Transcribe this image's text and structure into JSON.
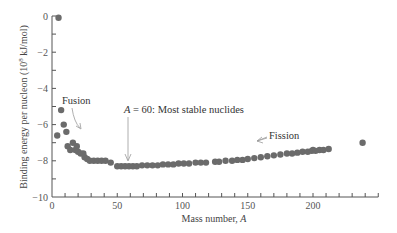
{
  "chart_data": {
    "type": "scatter",
    "title": "",
    "xlabel": "Mass number, A",
    "ylabel": "Binding energy per nucleon (10^8 kJ/mol)",
    "xlim": [
      0,
      250
    ],
    "ylim": [
      -10,
      0
    ],
    "x_ticks": [
      0,
      50,
      100,
      150,
      200
    ],
    "x_minor_step": 10,
    "y_ticks": [
      0,
      -2,
      -4,
      -6,
      -8,
      -10
    ],
    "y_minor_step": 1,
    "grid": false,
    "legend": null,
    "series": [
      {
        "name": "nuclides",
        "points": [
          [
            5,
            -0.1
          ],
          [
            4,
            -6.6
          ],
          [
            7,
            -5.2
          ],
          [
            9,
            -6.0
          ],
          [
            11,
            -6.4
          ],
          [
            12,
            -7.2
          ],
          [
            16,
            -7.0
          ],
          [
            14,
            -7.4
          ],
          [
            18,
            -7.4
          ],
          [
            19,
            -7.2
          ],
          [
            20,
            -7.5
          ],
          [
            22,
            -7.6
          ],
          [
            24,
            -7.6
          ],
          [
            25,
            -7.8
          ],
          [
            27,
            -7.9
          ],
          [
            29,
            -8.0
          ],
          [
            32,
            -8.0
          ],
          [
            35,
            -8.0
          ],
          [
            38,
            -8.0
          ],
          [
            41,
            -8.0
          ],
          [
            45,
            -8.1
          ],
          [
            50,
            -8.3
          ],
          [
            53,
            -8.3
          ],
          [
            56,
            -8.3
          ],
          [
            59,
            -8.3
          ],
          [
            62,
            -8.3
          ],
          [
            65,
            -8.3
          ],
          [
            69,
            -8.25
          ],
          [
            73,
            -8.25
          ],
          [
            77,
            -8.25
          ],
          [
            81,
            -8.25
          ],
          [
            85,
            -8.2
          ],
          [
            89,
            -8.2
          ],
          [
            93,
            -8.2
          ],
          [
            97,
            -8.15
          ],
          [
            101,
            -8.15
          ],
          [
            105,
            -8.15
          ],
          [
            110,
            -8.1
          ],
          [
            114,
            -8.1
          ],
          [
            118,
            -8.1
          ],
          [
            125,
            -8.05
          ],
          [
            128,
            -8.05
          ],
          [
            133,
            -8.0
          ],
          [
            138,
            -8.0
          ],
          [
            142,
            -7.95
          ],
          [
            146,
            -7.95
          ],
          [
            150,
            -7.9
          ],
          [
            155,
            -7.85
          ],
          [
            160,
            -7.8
          ],
          [
            165,
            -7.75
          ],
          [
            170,
            -7.7
          ],
          [
            175,
            -7.65
          ],
          [
            180,
            -7.6
          ],
          [
            184,
            -7.6
          ],
          [
            188,
            -7.55
          ],
          [
            192,
            -7.5
          ],
          [
            196,
            -7.5
          ],
          [
            199,
            -7.45
          ],
          [
            200,
            -7.4
          ],
          [
            202,
            -7.45
          ],
          [
            205,
            -7.4
          ],
          [
            208,
            -7.4
          ],
          [
            212,
            -7.35
          ],
          [
            238,
            -7.0
          ]
        ]
      }
    ],
    "annotations": [
      {
        "text": "Fusion",
        "x": 7,
        "y": -5.9,
        "arrow_to": [
          22,
          -6.5
        ]
      },
      {
        "text_prefix": "A",
        "text": " = 60:  Most stable nuclides",
        "x": 55,
        "y": -7.3,
        "arrow_to": [
          60,
          -8.1
        ]
      },
      {
        "text": "Fission",
        "x": 172,
        "y": -7.3,
        "arrow_to": [
          150,
          -7.5
        ]
      }
    ]
  },
  "labels": {
    "xlabel_prefix": "Mass number, ",
    "xlabel_var": "A",
    "ylabel_text": "Binding energy per nucleon (10",
    "ylabel_sup": "8",
    "ylabel_suffix": " kJ/mol)",
    "fusion": "Fusion",
    "stable_var": "A",
    "stable_rest": " = 60:  Most stable nuclides",
    "fission": "Fission"
  }
}
